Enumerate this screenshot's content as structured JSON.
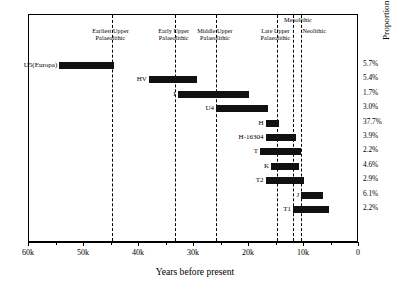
{
  "chart_data": {
    "type": "bar",
    "orientation": "horizontal-range",
    "title": "",
    "xlabel": "Years before present",
    "ylabel": "Proportion of European lineages today",
    "xlim": [
      60,
      0
    ],
    "x_reversed": true,
    "grid": false,
    "legend": "none",
    "xtick_labels": [
      "60k",
      "50k",
      "40k",
      "30k",
      "20k",
      "10k",
      "0"
    ],
    "xtick_values": [
      60,
      50,
      40,
      30,
      20,
      10,
      0
    ],
    "xtick_minor_values": [
      55,
      45,
      35,
      25,
      15,
      5
    ],
    "categories": [
      "U5(Europa)",
      "HV",
      "I",
      "U4",
      "H",
      "H-16304",
      "T",
      "K",
      "T2",
      "J",
      "T1"
    ],
    "series": [
      {
        "name": "Coalescence age range (thousands of years before present)",
        "ranges": [
          {
            "label": "U5(Europa)",
            "start_ka": 54.5,
            "end_ka": 44.5,
            "percent": "5.7%"
          },
          {
            "label": "HV",
            "start_ka": 38.2,
            "end_ka": 29.5,
            "percent": "5.4%"
          },
          {
            "label": "I",
            "start_ka": 33.0,
            "end_ka": 20.0,
            "percent": "1.7%"
          },
          {
            "label": "U4",
            "start_ka": 26.0,
            "end_ka": 16.5,
            "percent": "3.0%"
          },
          {
            "label": "H",
            "start_ka": 17.0,
            "end_ka": 14.5,
            "percent": "37.7%"
          },
          {
            "label": "H-16304",
            "start_ka": 17.0,
            "end_ka": 11.5,
            "percent": "3.9%"
          },
          {
            "label": "T",
            "start_ka": 18.0,
            "end_ka": 10.5,
            "percent": "2.2%"
          },
          {
            "label": "K",
            "start_ka": 16.0,
            "end_ka": 11.0,
            "percent": "4.6%"
          },
          {
            "label": "T2",
            "start_ka": 17.0,
            "end_ka": 10.0,
            "percent": "2.9%"
          },
          {
            "label": "J",
            "start_ka": 10.5,
            "end_ka": 6.5,
            "percent": "6.1%"
          },
          {
            "label": "T1",
            "start_ka": 12.0,
            "end_ka": 5.5,
            "percent": "2.2%"
          }
        ]
      }
    ],
    "annotations": {
      "era_dividers_ka": [
        45.0,
        33.5,
        26.0,
        15.0,
        12.0,
        10.5
      ],
      "eras": [
        {
          "name": "Earliest Upper\nPalaeolithic",
          "at_ka": 45.0
        },
        {
          "name": "Early Upper\nPalaeolithic",
          "at_ka": 33.5
        },
        {
          "name": "Middle Upper\nPalaeolithic",
          "at_ka": 26.0
        },
        {
          "name": "Late Upper\nPalaeolithic",
          "at_ka": 15.0
        },
        {
          "name": "Mesolithic",
          "at_ka": 12.0
        },
        {
          "name": "Neolithic",
          "at_ka": 10.5
        }
      ]
    },
    "percent_axis_values": [
      "5.7%",
      "5.4%",
      "1.7%",
      "3.0%",
      "37.7%",
      "3.9%",
      "2.2%",
      "4.6%",
      "2.9%",
      "6.1%",
      "2.2%"
    ],
    "colors": {
      "bar": "#111111",
      "axis": "#000000",
      "divider": "#000000",
      "background": "#ffffff"
    }
  }
}
